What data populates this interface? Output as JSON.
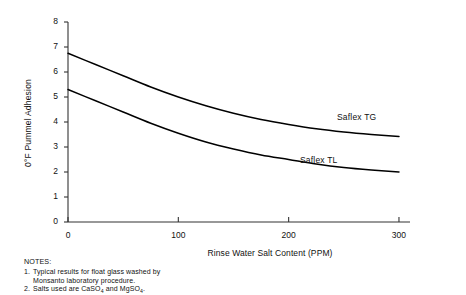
{
  "chart_data": {
    "type": "line",
    "title": "",
    "xlabel": "Rinse Water Salt Content (PPM)",
    "ylabel": "0°F Pummel Adhesion",
    "xlim": [
      0,
      310
    ],
    "ylim": [
      0,
      8
    ],
    "xticks": [
      0,
      100,
      200,
      300
    ],
    "yticks": [
      0,
      1,
      2,
      3,
      4,
      5,
      6,
      7,
      8
    ],
    "grid": false,
    "legend_position": "inline-right-annotations",
    "x": [
      0,
      25,
      50,
      75,
      100,
      125,
      150,
      175,
      200,
      225,
      250,
      275,
      300
    ],
    "series": [
      {
        "name": "Saflex TG",
        "label_x": 255,
        "label_y": 4.35,
        "values": [
          6.75,
          6.3,
          5.85,
          5.4,
          5.0,
          4.65,
          4.35,
          4.1,
          3.9,
          3.73,
          3.6,
          3.5,
          3.42
        ]
      },
      {
        "name": "Saflex TL",
        "label_x": 215,
        "label_y": 2.8,
        "values": [
          5.3,
          4.85,
          4.4,
          3.95,
          3.55,
          3.2,
          2.92,
          2.68,
          2.5,
          2.32,
          2.18,
          2.08,
          2.0
        ]
      }
    ],
    "axis_color": "#333333",
    "line_color": "#000000"
  },
  "ytick_labels": [
    "0",
    "1",
    "2",
    "3",
    "4",
    "5",
    "6",
    "7",
    "8"
  ],
  "xtick_labels": [
    "0",
    "100",
    "200",
    "300"
  ],
  "notes": {
    "title": "NOTES:",
    "items": [
      {
        "number": "1.",
        "line1": "Typical results for float glass washed by",
        "line2": "Monsanto laboratory procedure."
      },
      {
        "number": "2.",
        "line1_a": "Salts used are CaSO",
        "line1_sub1": "4",
        "line1_b": " and MgSO",
        "line1_sub2": "4",
        "line1_c": "."
      }
    ]
  }
}
